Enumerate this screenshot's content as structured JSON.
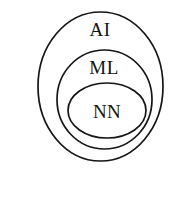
{
  "diagram": {
    "type": "nested-set-venn",
    "title": "",
    "background_color": "#ffffff",
    "outline_color": "#151515",
    "sets": [
      {
        "key": "ai",
        "label": "AI",
        "name": "Artificial Intelligence",
        "level": 1,
        "fill_color": "#ffffff",
        "stroke_color": "#151515",
        "stroke_width": 1.7,
        "shape": "ellipse",
        "cx": 100.5,
        "cy": 86.5,
        "rx": 62.5,
        "ry": 74.5,
        "label_x": 100,
        "label_y": 36
      },
      {
        "key": "ml",
        "label": "ML",
        "name": "Machine Learning",
        "level": 2,
        "fill_color": "#d6d6d6",
        "stroke_color": "#151515",
        "stroke_width": 1.7,
        "shape": "ellipse",
        "cx": 104.5,
        "cy": 99.5,
        "rx": 47.5,
        "ry": 49.5,
        "label_x": 104,
        "label_y": 74
      },
      {
        "key": "nn",
        "label": "NN",
        "name": "Neural Networks",
        "level": 3,
        "fill_color": "#ececec",
        "stroke_color": "#151515",
        "stroke_width": 1.7,
        "shape": "ellipse",
        "cx": 107,
        "cy": 110.5,
        "rx": 39,
        "ry": 27.5,
        "label_x": 107,
        "label_y": 118
      }
    ]
  }
}
